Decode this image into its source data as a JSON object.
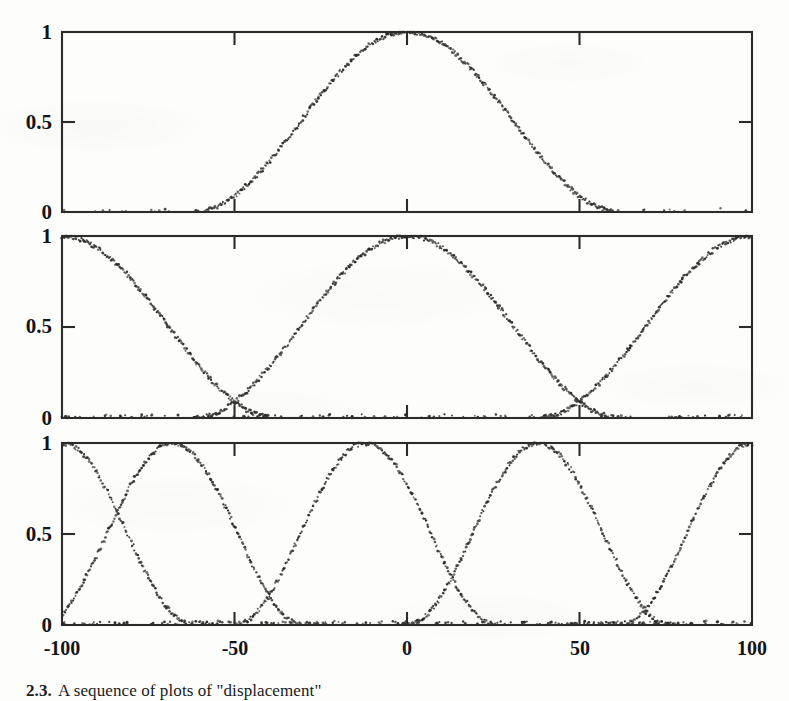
{
  "figure": {
    "caption_number": "2.3.",
    "caption_text": "A sequence of plots of \"displacement\"",
    "background_color": "#fdfdfc",
    "ink_color": "#2b2b2b"
  },
  "axes": {
    "y_ticks": [
      "0",
      "0.5",
      "1"
    ],
    "y_tick_values": [
      0,
      0.5,
      1
    ],
    "x_ticks": [
      "-100",
      "-50",
      "0",
      "50",
      "100"
    ],
    "x_tick_values": [
      -100,
      -50,
      0,
      50,
      100
    ],
    "xlim": [
      -100,
      100
    ],
    "ylim": [
      0,
      1
    ]
  },
  "panels": [
    {
      "index": 1,
      "n_curves": 1,
      "label": "panel-top"
    },
    {
      "index": 2,
      "n_curves": 3,
      "label": "panel-middle"
    },
    {
      "index": 3,
      "n_curves": 5,
      "label": "panel-bottom"
    }
  ],
  "chart_data": [
    {
      "type": "scatter",
      "title": "",
      "xlabel": "",
      "ylabel": "",
      "xlim": [
        -100,
        100
      ],
      "ylim": [
        0,
        1
      ],
      "grid": false,
      "legend": "none",
      "xticks": [
        -100,
        -50,
        0,
        50,
        100
      ],
      "yticks": [
        0,
        0.5,
        1
      ],
      "xticklabels": [
        "-100",
        "-50",
        "0",
        "50",
        "100"
      ],
      "yticklabels": [
        "0",
        "0.5",
        "1"
      ],
      "panel": 1,
      "description": "Single bell-shaped membership curve centred at 0 reaching 1 at its peak and decaying to 0 near the plot edges.",
      "series": [
        {
          "name": "curve-1",
          "center": 0,
          "peak": 1.0,
          "halfwidth": 62,
          "noise": 0.012
        }
      ]
    },
    {
      "type": "scatter",
      "title": "",
      "xlabel": "",
      "ylabel": "",
      "xlim": [
        -100,
        100
      ],
      "ylim": [
        0,
        1
      ],
      "grid": false,
      "legend": "none",
      "xticks": [
        -100,
        -50,
        0,
        50,
        100
      ],
      "yticks": [
        0,
        0.5,
        1
      ],
      "xticklabels": [
        "-100",
        "-50",
        "0",
        "50",
        "100"
      ],
      "yticklabels": [
        "0",
        "0.5",
        "1"
      ],
      "panel": 2,
      "description": "Three overlapping bell curves peaking at -100, 0 and +100; adjacent curves cross near x = -55 and x = +55 at about y = 0.17.",
      "crossings": [
        {
          "x": -55,
          "y": 0.17
        },
        {
          "x": 55,
          "y": 0.17
        }
      ],
      "series": [
        {
          "name": "curve-1",
          "center": -100,
          "peak": 1.0,
          "halfwidth": 62,
          "noise": 0.012
        },
        {
          "name": "curve-2",
          "center": 0,
          "peak": 1.0,
          "halfwidth": 62,
          "noise": 0.012
        },
        {
          "name": "curve-3",
          "center": 100,
          "peak": 1.0,
          "halfwidth": 62,
          "noise": 0.012
        }
      ]
    },
    {
      "type": "scatter",
      "title": "",
      "xlabel": "",
      "ylabel": "",
      "xlim": [
        -100,
        100
      ],
      "ylim": [
        0,
        1
      ],
      "grid": false,
      "legend": "none",
      "xticks": [
        -100,
        -50,
        0,
        50,
        100
      ],
      "yticks": [
        0,
        0.5,
        1
      ],
      "xticklabels": [
        "-100",
        "-50",
        "0",
        "50",
        "100"
      ],
      "yticklabels": [
        "0",
        "0.5",
        "1"
      ],
      "panel": 3,
      "description": "Five overlapping bell curves peaking near -100, -68, -12, 38 and 100; adjacent curves cross at about y = 0.17.",
      "crossings": [
        {
          "x": -84,
          "y": 0.17
        },
        {
          "x": -40,
          "y": 0.17
        },
        {
          "x": 13,
          "y": 0.17
        },
        {
          "x": 69,
          "y": 0.17
        }
      ],
      "series": [
        {
          "name": "curve-1",
          "center": -100,
          "peak": 1.0,
          "halfwidth": 38,
          "noise": 0.013
        },
        {
          "name": "curve-2",
          "center": -68,
          "peak": 1.0,
          "halfwidth": 38,
          "noise": 0.013
        },
        {
          "name": "curve-3",
          "center": -12,
          "peak": 1.0,
          "halfwidth": 38,
          "noise": 0.013
        },
        {
          "name": "curve-4",
          "center": 38,
          "peak": 1.0,
          "halfwidth": 38,
          "noise": 0.013
        },
        {
          "name": "curve-5",
          "center": 100,
          "peak": 1.0,
          "halfwidth": 38,
          "noise": 0.013
        }
      ]
    }
  ]
}
